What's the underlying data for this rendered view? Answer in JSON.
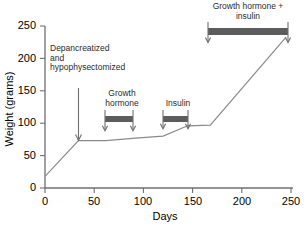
{
  "chart_data": {
    "type": "line",
    "title": "",
    "xlabel": "Days",
    "ylabel": "Weight (grams)",
    "xlim": [
      0,
      250
    ],
    "ylim": [
      0,
      250
    ],
    "xticks": [
      0,
      50,
      100,
      150,
      200,
      250
    ],
    "yticks": [
      0,
      50,
      100,
      150,
      200,
      250
    ],
    "grid": false,
    "legend": "none",
    "series": [
      {
        "name": "Body weight",
        "x": [
          0,
          34,
          62,
          92,
          120,
          145,
          168,
          245
        ],
        "y": [
          18,
          73,
          73,
          77,
          80,
          96,
          97,
          233
        ]
      }
    ],
    "annotations": [
      {
        "name": "depancreatized-hypophysectomized",
        "text": "Depancreatized\nand\nhypophysectomized",
        "marker": "down-arrow",
        "x": 34,
        "y_tip": 73
      },
      {
        "name": "growth-hormone",
        "text": "Growth\nhormone",
        "marker": "treatment-bar",
        "x_start": 61,
        "x_end": 89,
        "y": 110
      },
      {
        "name": "insulin",
        "text": "Insulin",
        "marker": "treatment-bar",
        "x_start": 120,
        "x_end": 145,
        "y": 110
      },
      {
        "name": "growth-hormone-plus-insulin",
        "text": "Growth hormone +\ninsulin",
        "marker": "treatment-bar",
        "x_start": 166,
        "x_end": 247,
        "y": 243
      }
    ],
    "colors": {
      "line": "#8a8a8a",
      "axis": "#6f6f6f",
      "bar": "#5c5c5c",
      "text": "#111111"
    }
  },
  "axes": {
    "y_title": "Weight (grams)",
    "x_title": "Days",
    "y_tick_labels": [
      "0",
      "50",
      "100",
      "150",
      "200",
      "250"
    ],
    "x_tick_labels": [
      "0",
      "50",
      "100",
      "150",
      "200",
      "250"
    ]
  },
  "labels": {
    "depancreatized": "Depancreatized\nand\nhypophysectomized",
    "growth_hormone": "Growth\nhormone",
    "insulin": "Insulin",
    "growth_hormone_insulin": "Growth hormone +\ninsulin"
  }
}
